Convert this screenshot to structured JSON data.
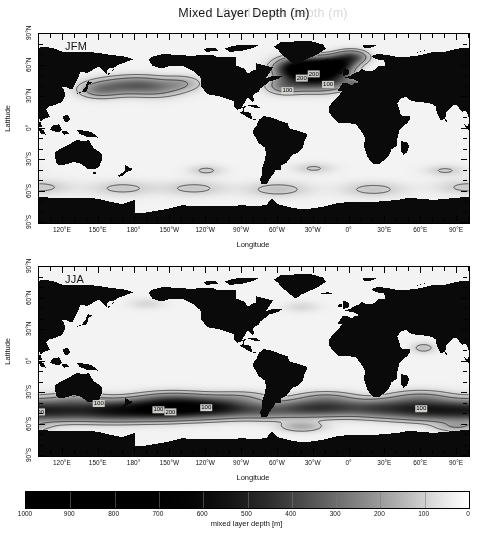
{
  "figure": {
    "title": "Mixed Layer Depth (m)",
    "title_ghost": "Mixed Layer Depth (m)"
  },
  "axes": {
    "xlabel": "Longitude",
    "ylabel": "Latitude",
    "xticks": [
      "120°E",
      "150°E",
      "180°",
      "150°W",
      "120°W",
      "90°W",
      "60°W",
      "30°W",
      "0°",
      "30°E",
      "60°E",
      "90°E",
      "120°E",
      "150°E"
    ],
    "yticks": [
      "90°N",
      "60°N",
      "30°N",
      "0°",
      "30°S",
      "60°S",
      "90°S"
    ]
  },
  "panels": [
    {
      "id": "jfm",
      "tag": "JFM",
      "contour_labels": [
        "200",
        "100",
        "100",
        "200"
      ]
    },
    {
      "id": "jja",
      "tag": "JJA",
      "contour_labels": [
        "100",
        "100",
        "100",
        "200",
        "100",
        "100"
      ]
    }
  ],
  "colorbar": {
    "title": "mixed layer depth [m]",
    "ticks": [
      "1000",
      "900",
      "800",
      "700",
      "600",
      "500",
      "400",
      "300",
      "200",
      "100",
      "0"
    ],
    "vmin": 0,
    "vmax": 1000,
    "reversed": true,
    "cmap_dark": "#000000",
    "cmap_light": "#ffffff"
  },
  "chart_data": {
    "type": "heatmap",
    "title": "Mixed Layer Depth (m)",
    "xlabel": "Longitude",
    "ylabel": "Latitude",
    "xlim": [
      100,
      460
    ],
    "ylim": [
      -90,
      90
    ],
    "xtick_values": [
      120,
      150,
      180,
      210,
      240,
      270,
      300,
      330,
      360,
      390,
      420,
      450,
      480,
      510
    ],
    "xtick_labels": [
      "120°E",
      "150°E",
      "180°",
      "150°W",
      "120°W",
      "90°W",
      "60°W",
      "30°W",
      "0°",
      "30°E",
      "60°E",
      "90°E",
      "120°E",
      "150°E"
    ],
    "ytick_values": [
      90,
      60,
      30,
      0,
      -30,
      -60,
      -90
    ],
    "ytick_labels": [
      "90°N",
      "60°N",
      "30°N",
      "0°",
      "30°S",
      "60°S",
      "90°S"
    ],
    "grid": false,
    "colorbar": {
      "label": "mixed layer depth [m]",
      "ticks": [
        1000,
        900,
        800,
        700,
        600,
        500,
        400,
        300,
        200,
        100,
        0
      ],
      "range": [
        0,
        1000
      ],
      "orientation": "horizontal",
      "reversed": true,
      "colormap": "gray_r"
    },
    "subplots": [
      {
        "panel": "JFM",
        "season": "January-February-March",
        "contour_levels": [
          100,
          200
        ],
        "contour_labels": [
          {
            "value": "200",
            "lon_deg": -40,
            "lat_deg": 48
          },
          {
            "value": "100",
            "lon_deg": -52,
            "lat_deg": 36
          },
          {
            "value": "100",
            "lon_deg": -18,
            "lat_deg": 42
          },
          {
            "value": "200",
            "lon_deg": -30,
            "lat_deg": 52
          }
        ],
        "deep_regions": [
          {
            "name": "North Atlantic (Labrador / Irminger / Nordic Seas)",
            "lon_range": [
              -60,
              10
            ],
            "lat_range": [
              40,
              65
            ],
            "peak_depth_m": 900
          },
          {
            "name": "North Pacific (Kuroshio Extension)",
            "lon_range": [
              140,
              200
            ],
            "lat_range": [
              30,
              45
            ],
            "peak_depth_m": 300
          },
          {
            "name": "Mediterranean / Gulf of Lions",
            "lon_range": [
              0,
              20
            ],
            "lat_range": [
              38,
              44
            ],
            "peak_depth_m": 300
          }
        ],
        "shallow_note": "Southern Hemisphere summer: mixed layers mostly < 100 m"
      },
      {
        "panel": "JJA",
        "season": "June-July-August",
        "contour_levels": [
          100,
          200
        ],
        "contour_labels": [
          {
            "value": "100",
            "lon_deg": 150,
            "lat_deg": -40
          },
          {
            "value": "100",
            "lon_deg": -160,
            "lat_deg": -46
          },
          {
            "value": "100",
            "lon_deg": -120,
            "lat_deg": -44
          },
          {
            "value": "200",
            "lon_deg": -150,
            "lat_deg": -48
          },
          {
            "value": "100",
            "lon_deg": 60,
            "lat_deg": -45
          },
          {
            "value": "100",
            "lon_deg": 100,
            "lat_deg": -48
          }
        ],
        "deep_regions": [
          {
            "name": "Southern Ocean (circumpolar band)",
            "lon_range": [
              -180,
              180
            ],
            "lat_range": [
              -55,
              -35
            ],
            "peak_depth_m": 600
          },
          {
            "name": "South Pacific sector",
            "lon_range": [
              -180,
              -90
            ],
            "lat_range": [
              -50,
              -38
            ],
            "peak_depth_m": 500
          },
          {
            "name": "South Indian sector",
            "lon_range": [
              40,
              120
            ],
            "lat_range": [
              -52,
              -40
            ],
            "peak_depth_m": 450
          }
        ],
        "shallow_note": "Northern Hemisphere summer: mixed layers mostly < 50 m"
      }
    ]
  }
}
